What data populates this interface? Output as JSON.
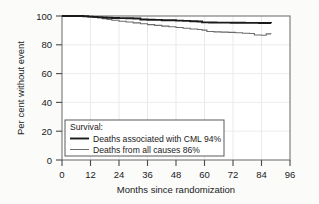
{
  "figure": {
    "background_color": "#fbfbfa",
    "plot_background_color": "#ffffff",
    "frame_color": "#6e6e6e",
    "grid_color": "#e8e8e8"
  },
  "chart_data": {
    "type": "line",
    "subtype": "kaplan-meier-step",
    "title": "",
    "xlabel": "Months since randomization",
    "ylabel": "Per cent without event",
    "xlim": [
      0,
      96
    ],
    "ylim": [
      0,
      100
    ],
    "xticks": [
      0,
      12,
      24,
      36,
      48,
      60,
      72,
      84,
      96
    ],
    "xticklabels": [
      "0",
      "12",
      "24",
      "36",
      "48",
      "60",
      "72",
      "84",
      "96"
    ],
    "yticks": [
      0,
      20,
      40,
      60,
      80,
      100
    ],
    "yticklabels": [
      "0",
      "20",
      "40",
      "60",
      "80",
      "100"
    ],
    "grid": true,
    "legend_position": "lower-left-inside",
    "legend_title": "Survival:",
    "series": [
      {
        "name": "Deaths associated with CML 94%",
        "color": "#1a1a1a",
        "linewidth": 1.9,
        "final_value": 94,
        "points": [
          [
            0,
            100
          ],
          [
            8,
            100
          ],
          [
            9,
            99.8
          ],
          [
            11,
            99.6
          ],
          [
            13,
            99.4
          ],
          [
            15,
            99.2
          ],
          [
            17,
            99.0
          ],
          [
            19,
            98.8
          ],
          [
            21,
            98.6
          ],
          [
            24,
            98.5
          ],
          [
            27,
            98.4
          ],
          [
            30,
            98.3
          ],
          [
            33,
            97.6
          ],
          [
            36,
            97.4
          ],
          [
            39,
            97.3
          ],
          [
            42,
            97.1
          ],
          [
            45,
            97.0
          ],
          [
            48,
            96.8
          ],
          [
            51,
            96.6
          ],
          [
            54,
            96.4
          ],
          [
            57,
            96.2
          ],
          [
            59,
            95.6
          ],
          [
            62,
            95.5
          ],
          [
            65,
            95.4
          ],
          [
            68,
            95.4
          ],
          [
            71,
            95.3
          ],
          [
            74,
            95.3
          ],
          [
            77,
            95.2
          ],
          [
            80,
            95.2
          ],
          [
            83,
            95.1
          ],
          [
            86,
            95.1
          ],
          [
            88,
            95.0
          ]
        ]
      },
      {
        "name": "Deaths from all causes 86%",
        "color": "#6b6b6b",
        "linewidth": 1.1,
        "final_value": 86,
        "points": [
          [
            0,
            100
          ],
          [
            8,
            100
          ],
          [
            9,
            99.7
          ],
          [
            11,
            99.4
          ],
          [
            13,
            99.0
          ],
          [
            15,
            98.6
          ],
          [
            17,
            98.2
          ],
          [
            19,
            97.6
          ],
          [
            21,
            97.0
          ],
          [
            24,
            96.4
          ],
          [
            27,
            95.8
          ],
          [
            30,
            95.2
          ],
          [
            33,
            94.6
          ],
          [
            36,
            94.0
          ],
          [
            39,
            93.5
          ],
          [
            42,
            93.0
          ],
          [
            45,
            92.5
          ],
          [
            48,
            92.0
          ],
          [
            51,
            91.5
          ],
          [
            54,
            91.0
          ],
          [
            57,
            90.6
          ],
          [
            59,
            90.2
          ],
          [
            61,
            89.2
          ],
          [
            64,
            89.0
          ],
          [
            67,
            88.8
          ],
          [
            70,
            88.6
          ],
          [
            73,
            88.4
          ],
          [
            76,
            88.0
          ],
          [
            79,
            87.8
          ],
          [
            81,
            86.8
          ],
          [
            84,
            86.6
          ],
          [
            86,
            87.6
          ],
          [
            88,
            87.5
          ]
        ]
      }
    ]
  },
  "legend": {
    "title": "Survival:",
    "entries": [
      {
        "label": "Deaths associated with CML 94%",
        "color": "#1a1a1a",
        "weight": "bold-line"
      },
      {
        "label": "Deaths from all causes 86%",
        "color": "#6b6b6b",
        "weight": "thin-line"
      }
    ]
  }
}
